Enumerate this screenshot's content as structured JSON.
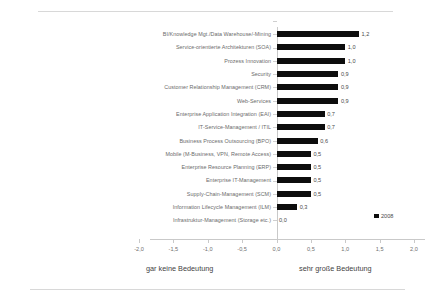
{
  "chart_data": {
    "type": "bar",
    "orientation": "horizontal",
    "title": "",
    "xlabel": "",
    "ylabel": "",
    "xlim": [
      -2.0,
      2.0
    ],
    "xticks": [
      "-2,0",
      "-1,5",
      "-1,0",
      "-0,5",
      "0,0",
      "0,5",
      "1,0",
      "1,5",
      "2,0"
    ],
    "xtick_values": [
      -2.0,
      -1.5,
      -1.0,
      -0.5,
      0.0,
      0.5,
      1.0,
      1.5,
      2.0
    ],
    "grid": false,
    "legend_position": "right-inside",
    "bar_color": "#0d0d0d",
    "categories": [
      "BI/Knowledge Mgt./Data Warehouse/-Mining",
      "Service-orientierte Architekturen (SOA)",
      "Prozess Innovation",
      "Security",
      "Customer Relationship Management (CRM)",
      "Web-Services",
      "Enterprise Application Integration (EAI)",
      "IT-Service-Management / ITIL",
      "Business Process Outsourcing (BPO)",
      "Mobile (M-Business, VPN, Remote Access)",
      "Enterprise Resource Planning (ERP)",
      "Enterprise IT-Management",
      "Supply-Chain-Management (SCM)",
      "Information Lifecycle Management (ILM)",
      "Infrastruktur-Management (Storage etc.)"
    ],
    "values": [
      1.2,
      1.0,
      1.0,
      0.9,
      0.9,
      0.9,
      0.7,
      0.7,
      0.6,
      0.5,
      0.5,
      0.5,
      0.5,
      0.3,
      0.0
    ],
    "value_labels": [
      "1,2",
      "1,0",
      "1,0",
      "0,9",
      "0,9",
      "0,9",
      "0,7",
      "0,7",
      "0,6",
      "0,5",
      "0,5",
      "0,5",
      "0,5",
      "0,3",
      "0,0"
    ],
    "series": [
      {
        "name": "2008",
        "values": [
          1.2,
          1.0,
          1.0,
          0.9,
          0.9,
          0.9,
          0.7,
          0.7,
          0.6,
          0.5,
          0.5,
          0.5,
          0.5,
          0.3,
          0.0
        ]
      }
    ],
    "legend": [
      "2008"
    ],
    "annotations": {
      "axis_left_caption": "gar keine Bedeutung",
      "axis_right_caption": "sehr große Bedeutung"
    }
  }
}
